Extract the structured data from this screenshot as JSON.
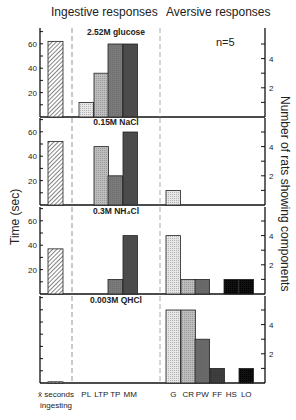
{
  "chart_data": {
    "type": "bar",
    "title": "",
    "group_labels": [
      "Ingestive responses",
      "Aversive responses"
    ],
    "annotation": "n=5",
    "ylabel_left": "Time (sec)",
    "ylabel_right": "Number of rats showing components",
    "left_ticks": [
      "20",
      "40",
      "60"
    ],
    "right_ticks": [
      "2",
      "4"
    ],
    "ylim_left": [
      0,
      70
    ],
    "ylim_right": [
      0,
      5.5
    ],
    "mean_label_lines": [
      "x̄ seconds",
      "ingesting"
    ],
    "categories": [
      "PL",
      "LTP",
      "TP",
      "MM",
      "G",
      "CR",
      "PW",
      "FF",
      "HS",
      "LO"
    ],
    "category_groups": {
      "ingestive": [
        "PL",
        "LTP",
        "TP",
        "MM"
      ],
      "aversive": [
        "G",
        "CR",
        "PW",
        "FF",
        "HS",
        "LO"
      ]
    },
    "panels": [
      {
        "stimulus": "2.52M glucose",
        "mean_seconds_ingesting": 62,
        "counts": [
          1,
          3,
          5,
          5,
          0,
          0,
          0,
          0,
          0,
          0
        ]
      },
      {
        "stimulus": "0.15M NaCl",
        "mean_seconds_ingesting": 52,
        "counts": [
          0,
          4,
          2,
          5,
          1,
          0,
          0,
          0,
          0,
          0
        ]
      },
      {
        "stimulus": "0.3M NH₄Cl",
        "mean_seconds_ingesting": 37,
        "counts": [
          0,
          0,
          1,
          4,
          4,
          1,
          1,
          0,
          1,
          1
        ]
      },
      {
        "stimulus": "0.003M QHCl",
        "mean_seconds_ingesting": 1,
        "counts": [
          0,
          0,
          0,
          0,
          5,
          5,
          3,
          1,
          0,
          1
        ]
      }
    ],
    "category_colors": [
      "#e6e6e6",
      "#bdbdbd",
      "#7a7a7a",
      "#4a4a4a",
      "#e6e6e6",
      "#bdbdbd",
      "#6a6a6a",
      "#3a3a3a",
      "#111111",
      "#111111"
    ]
  }
}
